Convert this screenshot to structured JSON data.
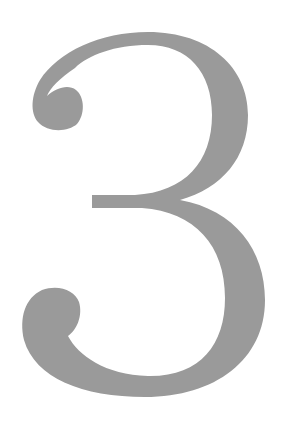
{
  "glyph": {
    "character": "3",
    "color": "#9a9a9a",
    "background": "#ffffff"
  }
}
